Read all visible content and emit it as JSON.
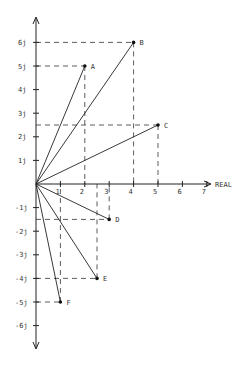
{
  "diagram": {
    "type": "argand-diagram",
    "x_axis_label": "REAL",
    "x_ticks": [
      "1",
      "2",
      "3",
      "4",
      "5",
      "6",
      "7"
    ],
    "y_ticks_pos": [
      "1j",
      "2j",
      "3j",
      "4j",
      "5j",
      "6j"
    ],
    "y_ticks_neg": [
      "-1j",
      "-2j",
      "-3j",
      "-4j",
      "-5j",
      "-6j"
    ],
    "colors": {
      "ink": "#222222",
      "background": "#ffffff"
    },
    "points": [
      {
        "label": "A",
        "re": 2,
        "im": 5
      },
      {
        "label": "B",
        "re": 4,
        "im": 6
      },
      {
        "label": "C",
        "re": 5,
        "im": 2.5
      },
      {
        "label": "D",
        "re": 3,
        "im": -1.5
      },
      {
        "label": "E",
        "re": 2.5,
        "im": -4
      },
      {
        "label": "F",
        "re": 1,
        "im": -5
      }
    ]
  }
}
